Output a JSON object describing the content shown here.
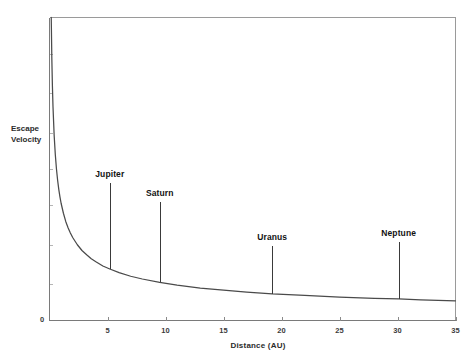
{
  "chart_data": {
    "type": "line",
    "title": "",
    "xlabel": "Distance  (AU)",
    "ylabel": "Escape Velocity",
    "ylabel_lines": [
      "Escape",
      "Velocity"
    ],
    "xlim": [
      0,
      35
    ],
    "ylim": [
      0,
      1
    ],
    "grid": false,
    "legend": "none",
    "x_ticks": [
      0,
      5,
      10,
      15,
      20,
      25,
      30,
      35
    ],
    "x_tick_labels": [
      "0",
      "5",
      "10",
      "15",
      "20",
      "25",
      "30",
      "35"
    ],
    "y_ticks": [
      0
    ],
    "y_tick_labels": [
      "0"
    ],
    "series": [
      {
        "name": "Escape velocity vs solar distance",
        "description": "Monotonically decreasing curve proportional to 1/sqrt(distance)",
        "x": [
          0.15,
          0.2,
          0.25,
          0.3,
          0.4,
          0.5,
          0.6,
          0.7,
          0.8,
          0.9,
          1.0,
          1.2,
          1.4,
          1.6,
          1.8,
          2.0,
          2.4,
          2.8,
          3.2,
          3.6,
          4.0,
          4.6,
          5.2,
          6.0,
          7.0,
          8.0,
          9.5,
          11.0,
          13.0,
          15.0,
          17.0,
          19.2,
          22.0,
          25.0,
          28.0,
          30.1,
          32.0,
          35.0
        ],
        "y": [
          1.0,
          0.866,
          0.775,
          0.707,
          0.612,
          0.548,
          0.5,
          0.463,
          0.433,
          0.408,
          0.387,
          0.354,
          0.327,
          0.306,
          0.289,
          0.274,
          0.25,
          0.231,
          0.217,
          0.204,
          0.194,
          0.18,
          0.17,
          0.158,
          0.146,
          0.137,
          0.126,
          0.117,
          0.107,
          0.1,
          0.094,
          0.088,
          0.083,
          0.077,
          0.073,
          0.071,
          0.068,
          0.065
        ]
      }
    ],
    "annotations": [
      {
        "label": "Jupiter",
        "x": 5.2,
        "y_base": 0.17,
        "y_top": 0.455
      },
      {
        "label": "Saturn",
        "x": 9.5,
        "y_base": 0.126,
        "y_top": 0.39
      },
      {
        "label": "Uranus",
        "x": 19.2,
        "y_base": 0.088,
        "y_top": 0.245
      },
      {
        "label": "Neptune",
        "x": 30.1,
        "y_base": 0.071,
        "y_top": 0.258
      }
    ]
  },
  "colors": {
    "background": "#ffffff",
    "curve": "#4a4a4a",
    "axis": "#7a7a7a",
    "frame": "#9a9a9a",
    "text": "#1a1a1a"
  }
}
